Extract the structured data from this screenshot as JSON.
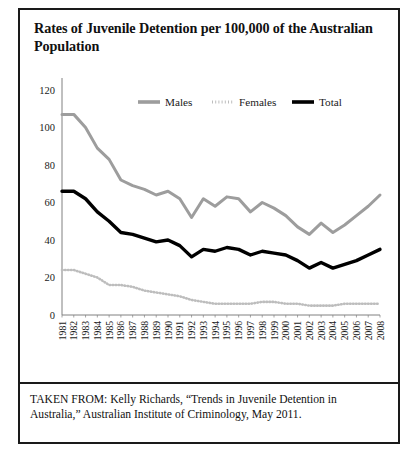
{
  "figure": {
    "title": "Rates of Juvenile Detention per 100,000 of the Australian Population",
    "source_text": "TAKEN FROM: Kelly Richards, “Trends in Juvenile Detention in Australia,” Australian Institute of Criminology, May 2011."
  },
  "colors": {
    "males": "#9d9d9d",
    "females": "#bdbdbd",
    "total": "#000000",
    "axis": "#808080",
    "frame": "#1a1a1a",
    "background": "#ffffff"
  },
  "chart_data": {
    "type": "line",
    "title": "Rates of Juvenile Detention per 100,000 of the Australian Population",
    "xlabel": "",
    "ylabel": "",
    "xlim": [
      1981,
      2008
    ],
    "ylim": [
      0,
      120
    ],
    "ytick_step": 20,
    "grid": false,
    "legend_position": "top-center",
    "categories": [
      "1981",
      "1982",
      "1983",
      "1984",
      "1985",
      "1986",
      "1987",
      "1988",
      "1989",
      "1990",
      "1991",
      "1992",
      "1993",
      "1994",
      "1995",
      "1996",
      "1997",
      "1998",
      "1999",
      "2000",
      "2001",
      "2002",
      "2003",
      "2004",
      "2005",
      "2006",
      "2007",
      "2008"
    ],
    "yticks": [
      0,
      20,
      40,
      60,
      80,
      100,
      120
    ],
    "series": [
      {
        "name": "Males",
        "color": "#9d9d9d",
        "style": "solid",
        "values": [
          107,
          107,
          100,
          89,
          83,
          72,
          69,
          67,
          64,
          66,
          62,
          52,
          62,
          58,
          63,
          62,
          55,
          60,
          57,
          53,
          47,
          43,
          49,
          44,
          48,
          53,
          58,
          64
        ]
      },
      {
        "name": "Females",
        "color": "#bdbdbd",
        "style": "dotted",
        "values": [
          24,
          24,
          22,
          20,
          16,
          16,
          15,
          13,
          12,
          11,
          10,
          8,
          7,
          6,
          6,
          6,
          6,
          7,
          7,
          6,
          6,
          5,
          5,
          5,
          6,
          6,
          6,
          6
        ]
      },
      {
        "name": "Total",
        "color": "#000000",
        "style": "solid",
        "values": [
          66,
          66,
          62,
          55,
          50,
          44,
          43,
          41,
          39,
          40,
          37,
          31,
          35,
          34,
          36,
          35,
          32,
          34,
          33,
          32,
          29,
          25,
          28,
          25,
          27,
          29,
          32,
          35
        ]
      }
    ]
  }
}
